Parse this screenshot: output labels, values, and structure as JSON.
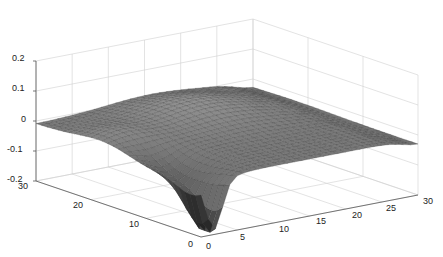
{
  "chart_data": {
    "type": "surface",
    "title": "",
    "xlabel": "",
    "ylabel": "",
    "zlabel": "",
    "x_ticks": [
      0,
      5,
      10,
      15,
      20,
      25,
      30
    ],
    "y_ticks": [
      0,
      10,
      20,
      30
    ],
    "z_ticks": [
      -0.2,
      -0.1,
      0,
      0.1,
      0.2
    ],
    "xlim": [
      0,
      30
    ],
    "ylim": [
      0,
      30
    ],
    "zlim": [
      -0.2,
      0.2
    ],
    "grid": true,
    "colormap": "gray",
    "surface_samples": [
      {
        "x": 0,
        "y": 30,
        "z": -0.02
      },
      {
        "x": 0,
        "y": 20,
        "z": -0.01
      },
      {
        "x": 2,
        "y": 10,
        "z": -0.08
      },
      {
        "x": 2,
        "y": 1,
        "z": -0.2
      },
      {
        "x": 10,
        "y": 20,
        "z": 0.03
      },
      {
        "x": 15,
        "y": 25,
        "z": 0.05
      },
      {
        "x": 20,
        "y": 20,
        "z": 0.05
      },
      {
        "x": 28,
        "y": 15,
        "z": 0.0
      },
      {
        "x": 30,
        "y": 10,
        "z": -0.02
      }
    ]
  },
  "axes": {
    "z_labels": [
      "0.2",
      "0.1",
      "0",
      "-0.1",
      "-0.2"
    ],
    "y_labels": [
      "30",
      "20",
      "10",
      "0"
    ],
    "x_labels": [
      "0",
      "5",
      "10",
      "15",
      "20",
      "25",
      "30"
    ]
  }
}
